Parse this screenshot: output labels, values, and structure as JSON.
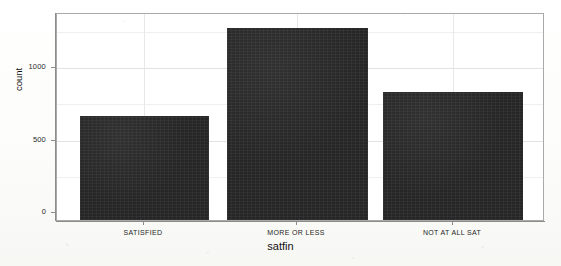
{
  "chart_data": {
    "type": "bar",
    "title": "",
    "subtitle": "",
    "xlabel": "satfin",
    "ylabel": "count",
    "categories": [
      "SATISFIED",
      "MORE OR LESS",
      "NOT AT ALL SAT"
    ],
    "values": [
      717,
      1324,
      883
    ],
    "series": [
      {
        "name": "count",
        "values": [
          717,
          1324,
          883
        ]
      }
    ],
    "ylim": [
      0,
      1430
    ],
    "xlim": [
      0,
      3
    ],
    "y_ticks": [
      0,
      500,
      1000
    ],
    "y_tick_labels": [
      "0",
      "500",
      "1000"
    ],
    "x_tick_labels": [
      "SATISFIED",
      "MORE OR LESS",
      "NOT AT ALL SAT"
    ],
    "grid": true,
    "grid_axis": "both",
    "legend": false,
    "legend_position": "none",
    "bar_color": "#262626",
    "panel_background": "#ffffff",
    "panel_border_color": "#a9a9a9",
    "grid_color": "#e2e2e2",
    "annotations": []
  },
  "axes": {
    "y": {
      "label": "count",
      "ticks": [
        {
          "label": "1000",
          "value": 1000
        },
        {
          "label": "500",
          "value": 500
        },
        {
          "label": "0",
          "value": 0
        }
      ]
    },
    "x": {
      "label": "satfin",
      "ticks": [
        {
          "label": "SATISFIED"
        },
        {
          "label": "MORE OR LESS"
        },
        {
          "label": "NOT AT ALL SAT"
        }
      ]
    }
  }
}
